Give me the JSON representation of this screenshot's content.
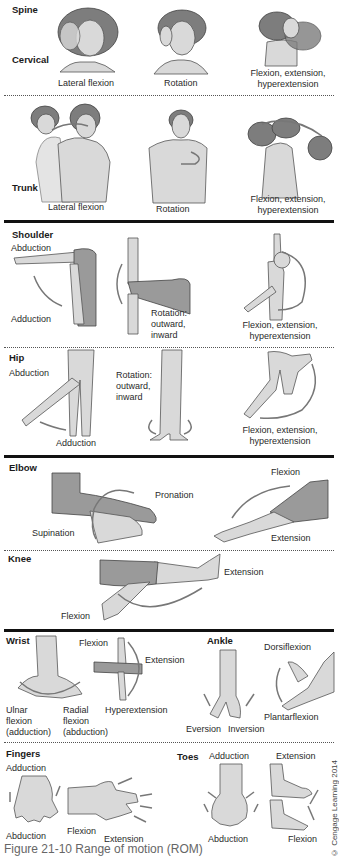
{
  "figure": {
    "caption": "Figure 21-10  Range of motion (ROM)",
    "credit": "© Cengage Learning 2014",
    "colors": {
      "skin_light": "#d9d9d9",
      "skin_dark": "#9a9a9a",
      "arrow": "#777777",
      "rule": "#111111"
    }
  },
  "sections": {
    "spine": {
      "title": "Spine",
      "cervical": {
        "title": "Cervical",
        "labels": [
          "Lateral flexion",
          "Rotation",
          "Flexion, extension,",
          "hyperextension"
        ]
      },
      "trunk": {
        "title": "Trunk",
        "labels": [
          "Lateral flexion",
          "Rotation",
          "Flexion, extension,",
          "hyperextension"
        ]
      }
    },
    "shoulder": {
      "title": "Shoulder",
      "labels": [
        "Abduction",
        "Adduction",
        "Rotation:",
        "outward,",
        "inward",
        "Flexion, extension,",
        "hyperextension"
      ]
    },
    "hip": {
      "title": "Hip",
      "labels": [
        "Abduction",
        "Adduction",
        "Rotation:",
        "outward,",
        "inward",
        "Flexion, extension,",
        "hyperextension"
      ]
    },
    "elbow": {
      "title": "Elbow",
      "labels": [
        "Pronation",
        "Supination",
        "Flexion",
        "Extension"
      ]
    },
    "knee": {
      "title": "Knee",
      "labels": [
        "Extension",
        "Flexion"
      ]
    },
    "wrist": {
      "title": "Wrist",
      "labels": [
        "Flexion",
        "Extension",
        "Hyperextension",
        "Ulnar",
        "flexion",
        "(adduction)",
        "Radial",
        "flexion",
        "(abduction)"
      ]
    },
    "ankle": {
      "title": "Ankle",
      "labels": [
        "Dorsiflexion",
        "Plantarflexion",
        "Eversion",
        "Inversion"
      ]
    },
    "fingers": {
      "title": "Fingers",
      "labels": [
        "Adduction",
        "Abduction",
        "Flexion",
        "Extension"
      ]
    },
    "toes": {
      "title": "Toes",
      "labels": [
        "Adduction",
        "Abduction",
        "Extension",
        "Flexion"
      ]
    }
  }
}
